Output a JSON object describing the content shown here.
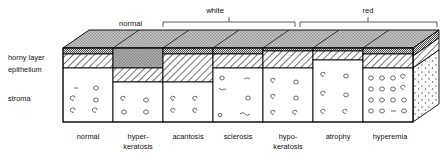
{
  "diagram": {
    "title_visible": false,
    "group_brackets": [
      {
        "name": "normal",
        "label": "normal",
        "type": "plain-label",
        "x_start": 119,
        "x_end": 156
      },
      {
        "name": "white",
        "label": "white",
        "type": "bracket",
        "x_start": 163,
        "x_end": 295
      },
      {
        "name": "red",
        "label": "red",
        "type": "bracket",
        "x_start": 300,
        "x_end": 437
      }
    ],
    "side_labels": [
      {
        "name": "horny-layer",
        "label": "horny layer",
        "y": 57
      },
      {
        "name": "epithelium",
        "label": "epithelium",
        "y": 69
      },
      {
        "name": "stroma",
        "label": "stroma",
        "y": 98
      }
    ],
    "columns": [
      {
        "name": "normal",
        "label_line1": "normal",
        "label_line2": "",
        "horny": "thin-speckle",
        "epithelium": "normal-hatch",
        "stroma": "sparse-circles"
      },
      {
        "name": "hyperkeratosis",
        "label_line1": "hyper-",
        "label_line2": "keratosis",
        "horny": "thick-dark",
        "epithelium": "normal-hatch",
        "stroma": "sparse-circles"
      },
      {
        "name": "acantosis",
        "label_line1": "acantosis",
        "label_line2": "",
        "horny": "thin-speckle",
        "epithelium": "thick-hatch",
        "stroma": "sparse-circles"
      },
      {
        "name": "sclerosis",
        "label_line1": "sclerosis",
        "label_line2": "",
        "horny": "thin-speckle",
        "epithelium": "normal-hatch",
        "stroma": "fibrous-dashes"
      },
      {
        "name": "hypokeratosis",
        "label_line1": "hypo-",
        "label_line2": "keratosis",
        "horny": "very-thin",
        "epithelium": "normal-hatch",
        "stroma": "sparse-circles"
      },
      {
        "name": "atrophy",
        "label_line1": "atrophy",
        "label_line2": "",
        "horny": "very-thin",
        "epithelium": "thin-hatch",
        "stroma": "sparse-circles"
      },
      {
        "name": "hyperemia",
        "label_line1": "hyperemia",
        "label_line2": "",
        "horny": "thin-speckle",
        "epithelium": "normal-hatch",
        "stroma": "dense-circles"
      }
    ],
    "colors": {
      "top_face": "#8f8f8f",
      "horny_band": "#b9b9b9",
      "dark_horny": "#8a8a8a",
      "stroma_fill": "#ffffff",
      "outline": "#000000",
      "side_face": "#f4f4f4"
    },
    "layout": {
      "front_left_x": 63,
      "front_right_x": 413,
      "front_top_y": 48,
      "front_bottom_y": 122,
      "depth_dx": 26,
      "depth_dy": -18,
      "column_edges": [
        63,
        113,
        163,
        213,
        263,
        313,
        363,
        413
      ]
    }
  }
}
